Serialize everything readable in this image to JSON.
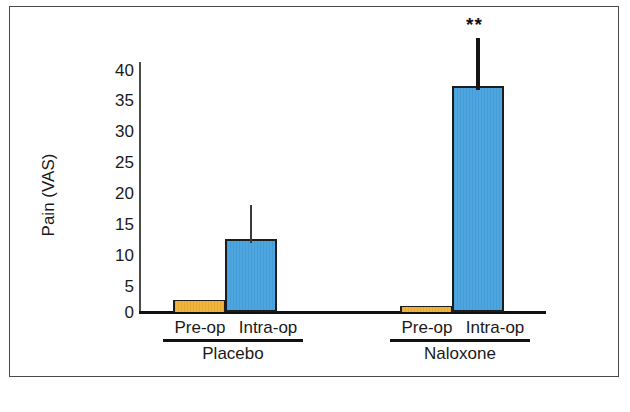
{
  "figure": {
    "background_color": "#ffffff",
    "border_color": "#4a4a4a"
  },
  "chart_data": {
    "type": "bar",
    "title": "",
    "subtitle": "",
    "xlabel": "",
    "ylabel": "Pain  (VAS)",
    "ylim": [
      0,
      40
    ],
    "yticks": [
      0,
      5,
      10,
      15,
      20,
      25,
      30,
      35,
      40
    ],
    "ytick_labels": [
      "0",
      "5",
      "10",
      "15",
      "20",
      "25",
      "30",
      "35",
      "40"
    ],
    "grid": false,
    "legend": null,
    "legend_position": "none",
    "groups": [
      "Placebo",
      "Naloxone"
    ],
    "categories": [
      "Pre-op",
      "Intra-op"
    ],
    "colors": {
      "pre_op": "#f0b63c",
      "intra_op": "#4da6e0",
      "bar_outline": "#1d1d1d",
      "error_bar": "#3b3b3b",
      "axis": "#111111"
    },
    "bars": [
      {
        "group": "Placebo",
        "category": "Pre-op",
        "value": 2,
        "color": "#f0b63c",
        "error_upper": null,
        "annotation": ""
      },
      {
        "group": "Placebo",
        "category": "Intra-op",
        "value": 12,
        "color": "#4da6e0",
        "error_upper": 17.5,
        "annotation": ""
      },
      {
        "group": "Naloxone",
        "category": "Pre-op",
        "value": 1,
        "color": "#f0b63c",
        "error_upper": null,
        "annotation": ""
      },
      {
        "group": "Naloxone",
        "category": "Intra-op",
        "value": 37,
        "color": "#4da6e0",
        "error_upper": 45,
        "annotation": "**"
      }
    ],
    "annotations": [
      {
        "text": "**",
        "at_group": "Naloxone",
        "at_category": "Intra-op",
        "meaning": "significance marker"
      }
    ]
  },
  "axis": {
    "y_title": "Pain  (VAS)",
    "ticks": [
      "40",
      "35",
      "30",
      "25",
      "20",
      "15",
      "10",
      "5",
      "0"
    ]
  },
  "labels": {
    "placebo_pre_op": "Pre-op",
    "placebo_intra_op": "Intra-op",
    "naloxone_pre_op": "Pre-op",
    "naloxone_intra_op": "Intra-op",
    "group_placebo": "Placebo",
    "group_naloxone": "Naloxone",
    "significance_naloxone_intra_op": "**"
  }
}
